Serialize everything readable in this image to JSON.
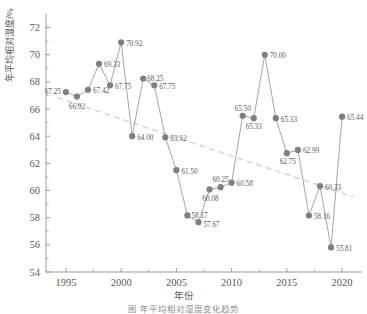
{
  "chart_data": {
    "type": "line",
    "title": "",
    "xlabel": "年份",
    "ylabel": "年平均相对湿度/%",
    "xlim": [
      1993.2,
      2021.8
    ],
    "ylim": [
      54,
      73
    ],
    "xticks": [
      1995,
      2000,
      2005,
      2010,
      2015,
      2020
    ],
    "xticklabels": [
      "1995",
      "2000",
      "2005",
      "2010",
      "2015",
      "2020"
    ],
    "yticks": [
      54,
      56,
      58,
      60,
      62,
      64,
      66,
      68,
      70,
      72
    ],
    "yticklabels": [
      "54",
      "56",
      "58",
      "60",
      "62",
      "64",
      "66",
      "68",
      "70",
      "72"
    ],
    "grid": false,
    "legend": null,
    "x": [
      1995,
      1996,
      1997,
      1998,
      1999,
      2000,
      2001,
      2002,
      2003,
      2004,
      2005,
      2006,
      2007,
      2008,
      2009,
      2010,
      2011,
      2012,
      2013,
      2014,
      2015,
      2016,
      2017,
      2018,
      2019,
      2020
    ],
    "values": [
      67.25,
      66.92,
      67.42,
      69.33,
      67.75,
      70.92,
      64.0,
      68.25,
      67.75,
      63.92,
      61.5,
      58.17,
      57.67,
      60.08,
      60.25,
      60.58,
      65.5,
      65.33,
      70.0,
      65.33,
      62.75,
      62.99,
      58.16,
      60.33,
      55.81,
      65.44
    ],
    "point_labels": [
      "67.25",
      "66.92",
      "67.42",
      "69.33",
      "67.75",
      "70.92",
      "64.00",
      "68.25",
      "67.75",
      "63.92",
      "61.50",
      "58.17",
      "57.67",
      "60.08",
      "60.25",
      "60.58",
      "65.50",
      "65.33",
      "70.00",
      "65.33",
      "62.75",
      "62.99",
      "58.16",
      "60.33",
      "55.81",
      "65.44"
    ],
    "trendline": {
      "x": [
        1994.2,
        2021.0
      ],
      "y": [
        66.85,
        59.55
      ],
      "style": "dashed"
    },
    "marker_color": "#7f7f7f",
    "line_color": "#9a9a9a",
    "trend_color": "#d8d8d8",
    "axis_color": "#9b9b9b"
  },
  "caption": "图   年平均相对湿度变化趋势"
}
